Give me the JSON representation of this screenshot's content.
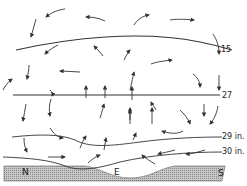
{
  "diagram": {
    "type": "atmospheric circulation cross-section",
    "isobar_labels": {
      "top": "15",
      "upper_mid": "27",
      "lower_mid": "29 in.",
      "bottom": "30 in."
    },
    "ground_labels": {
      "north": "N",
      "equator": "E",
      "south": "S"
    },
    "colors": {
      "line": "#333333",
      "ground_hatch": "#9a9a9a",
      "background": "#ffffff"
    }
  }
}
